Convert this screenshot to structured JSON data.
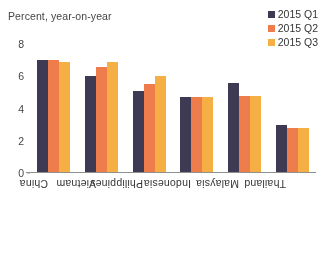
{
  "chart_data": {
    "type": "bar",
    "title": "Percent, year-on-year",
    "xlabel": "",
    "ylabel": "Percent, year-on-year",
    "categories": [
      "China",
      "Vietnam",
      "Philippines",
      "Indonesia",
      "Malaysia",
      "Thailand"
    ],
    "series": [
      {
        "name": "2015 Q1",
        "color": "#3a3550",
        "values": [
          7.0,
          6.0,
          5.1,
          4.7,
          5.6,
          3.0
        ]
      },
      {
        "name": "2015 Q2",
        "color": "#f47b47",
        "values": [
          7.0,
          6.6,
          5.5,
          4.7,
          4.8,
          2.8
        ]
      },
      {
        "name": "2015 Q3",
        "color": "#fbb040",
        "values": [
          6.9,
          6.9,
          6.0,
          4.7,
          4.8,
          2.8
        ]
      }
    ],
    "ylim": [
      0,
      8
    ],
    "yticks": [
      0,
      2,
      4,
      6,
      8
    ],
    "ytick_labels": [
      "0",
      "2",
      "4",
      "6",
      "8"
    ],
    "grid": false,
    "legend_position": "top-right",
    "background": "#ffffff",
    "axis_color": "#8e8e8e"
  }
}
